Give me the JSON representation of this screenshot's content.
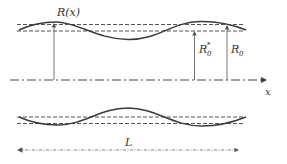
{
  "diagram": {
    "labels": {
      "radius_function": "R(x)",
      "radius_star_base": "R",
      "radius_star_sup": "*",
      "radius_star_sub": "0",
      "radius_base": "R",
      "radius_sub": "0",
      "axis": "x",
      "length": "L"
    },
    "colors": {
      "curve": "#3a3a3a",
      "dashed": "#555555",
      "axis": "#444444",
      "arrow": "#666666"
    }
  }
}
